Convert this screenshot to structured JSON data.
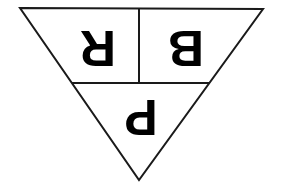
{
  "diagram": {
    "type": "inverted-triangle",
    "rotation": "180deg",
    "stroke_color": "#1a1a1a",
    "background_color": "#ffffff",
    "sections": [
      {
        "id": "top-left",
        "label": "R"
      },
      {
        "id": "top-right",
        "label": "B"
      },
      {
        "id": "bottom",
        "label": "P"
      }
    ]
  }
}
